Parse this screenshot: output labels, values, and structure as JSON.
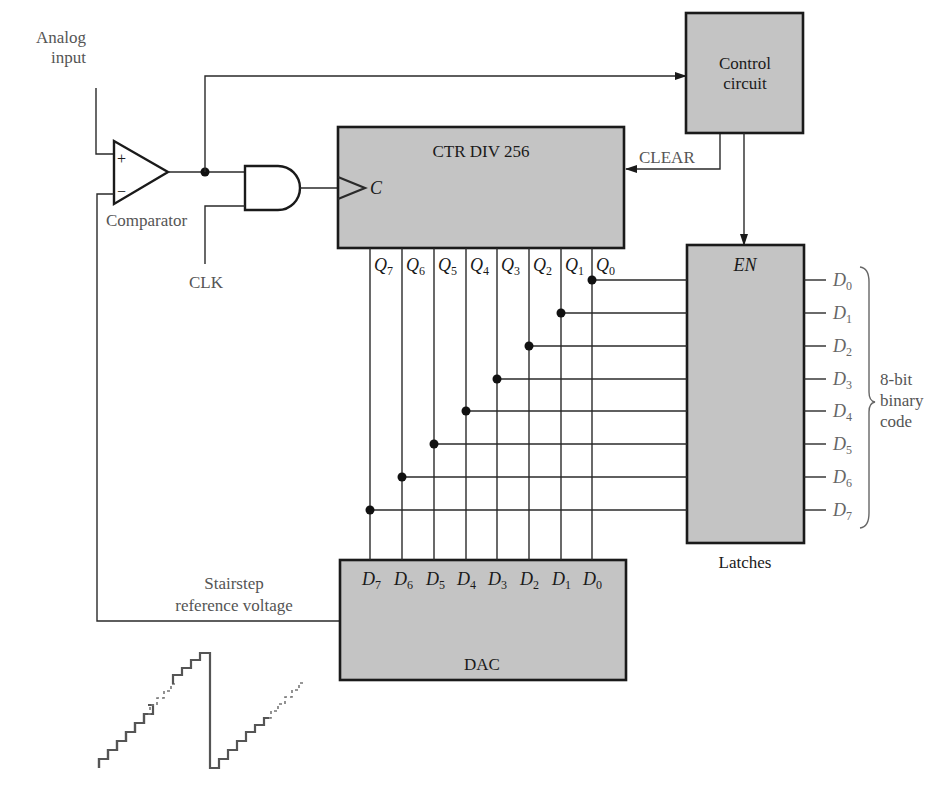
{
  "diagram": {
    "labels": {
      "analog_input_line1": "Analog",
      "analog_input_line2": "input",
      "comparator": "Comparator",
      "comparator_plus": "+",
      "comparator_minus": "−",
      "clk": "CLK",
      "clear": "CLEAR",
      "stairstep_line1": "Stairstep",
      "stairstep_line2": "reference voltage",
      "latches": "Latches",
      "code_line1": "8-bit",
      "code_line2": "binary",
      "code_line3": "code"
    },
    "blocks": {
      "control": {
        "line1": "Control",
        "line2": "circuit"
      },
      "counter": {
        "title": "CTR DIV 256",
        "clock_input": "C"
      },
      "latches": {
        "enable": "EN"
      },
      "dac": {
        "title": "DAC"
      }
    },
    "counter_outputs": [
      {
        "base": "Q",
        "sub": "7"
      },
      {
        "base": "Q",
        "sub": "6"
      },
      {
        "base": "Q",
        "sub": "5"
      },
      {
        "base": "Q",
        "sub": "4"
      },
      {
        "base": "Q",
        "sub": "3"
      },
      {
        "base": "Q",
        "sub": "2"
      },
      {
        "base": "Q",
        "sub": "1"
      },
      {
        "base": "Q",
        "sub": "0"
      }
    ],
    "dac_inputs": [
      {
        "base": "D",
        "sub": "7"
      },
      {
        "base": "D",
        "sub": "6"
      },
      {
        "base": "D",
        "sub": "5"
      },
      {
        "base": "D",
        "sub": "4"
      },
      {
        "base": "D",
        "sub": "3"
      },
      {
        "base": "D",
        "sub": "2"
      },
      {
        "base": "D",
        "sub": "1"
      },
      {
        "base": "D",
        "sub": "0"
      }
    ],
    "latch_outputs": [
      {
        "base": "D",
        "sub": "0"
      },
      {
        "base": "D",
        "sub": "1"
      },
      {
        "base": "D",
        "sub": "2"
      },
      {
        "base": "D",
        "sub": "3"
      },
      {
        "base": "D",
        "sub": "4"
      },
      {
        "base": "D",
        "sub": "5"
      },
      {
        "base": "D",
        "sub": "6"
      },
      {
        "base": "D",
        "sub": "7"
      }
    ],
    "colors": {
      "block_fill": "#c4c4c4",
      "stroke": "#1a1a1a",
      "label_grey": "#555555"
    }
  }
}
